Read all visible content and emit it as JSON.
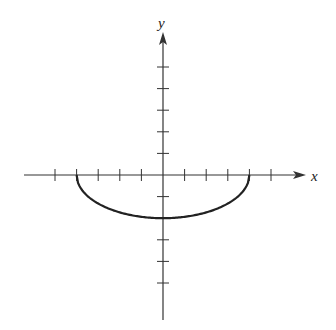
{
  "chart_data": {
    "type": "line",
    "title": "",
    "xlabel": "x",
    "ylabel": "y",
    "xlim": [
      -6.3,
      6.6
    ],
    "ylim": [
      -6.6,
      6.6
    ],
    "grid": false,
    "legend": null,
    "x_ticks": [
      -5,
      -4,
      -3,
      -2,
      -1,
      1,
      2,
      3,
      4,
      5
    ],
    "y_ticks": [
      -5,
      -4,
      -3,
      -2,
      -1,
      1,
      2,
      3,
      4,
      5
    ],
    "tick_labels_shown": false,
    "series": [
      {
        "name": "lower half-ellipse",
        "equation": "y = -2*sqrt(1 - x^2/16)",
        "domain": [
          -4,
          4
        ],
        "points": [
          {
            "x": -4,
            "y": 0
          },
          {
            "x": -3,
            "y": -1.32
          },
          {
            "x": -2,
            "y": -1.73
          },
          {
            "x": -1,
            "y": -1.94
          },
          {
            "x": 0,
            "y": -2
          },
          {
            "x": 1,
            "y": -1.94
          },
          {
            "x": 2,
            "y": -1.73
          },
          {
            "x": 3,
            "y": -1.32
          },
          {
            "x": 4,
            "y": 0
          }
        ],
        "color": "#222222"
      }
    ]
  },
  "labels": {
    "x_axis": "x",
    "y_axis": "y"
  },
  "colors": {
    "axis": "#333333",
    "curve": "#222222",
    "background": "#ffffff"
  }
}
